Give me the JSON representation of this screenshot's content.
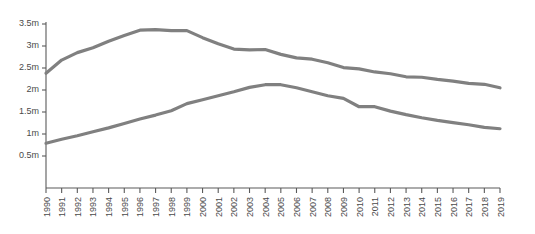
{
  "chart_data": {
    "type": "line",
    "title": "",
    "subtitle": "",
    "xlabel": "",
    "ylabel": "",
    "grid": false,
    "legend_position": "none",
    "xlim": [
      1990,
      2019
    ],
    "ylim": [
      0.25,
      3.5
    ],
    "y_tick_values": [
      0.5,
      1,
      1.5,
      2,
      2.5,
      3,
      3.5
    ],
    "y_tick_labels": [
      "0.5m",
      "1m",
      "1.5m",
      "2m",
      "2.5m",
      "3m",
      "3.5m"
    ],
    "x": [
      1990,
      1991,
      1992,
      1993,
      1994,
      1995,
      1996,
      1997,
      1998,
      1999,
      2000,
      2001,
      2002,
      2003,
      2004,
      2005,
      2006,
      2007,
      2008,
      2009,
      2010,
      2011,
      2012,
      2013,
      2014,
      2015,
      2016,
      2017,
      2018,
      2019
    ],
    "categories": [
      "1990",
      "1991",
      "1992",
      "1993",
      "1994",
      "1995",
      "1996",
      "1997",
      "1998",
      "1999",
      "2000",
      "2001",
      "2002",
      "2003",
      "2004",
      "2005",
      "2006",
      "2007",
      "2008",
      "2009",
      "2010",
      "2011",
      "2012",
      "2013",
      "2014",
      "2015",
      "2016",
      "2017",
      "2018",
      "2019"
    ],
    "series": [
      {
        "name": "upper-series",
        "color": "#808080",
        "values": [
          2.38,
          2.68,
          2.85,
          2.96,
          3.11,
          3.24,
          3.36,
          3.37,
          3.35,
          3.35,
          3.19,
          3.05,
          2.93,
          2.91,
          2.92,
          2.81,
          2.73,
          2.7,
          2.62,
          2.51,
          2.48,
          2.41,
          2.37,
          2.3,
          2.29,
          2.24,
          2.2,
          2.15,
          2.13,
          2.05
        ]
      },
      {
        "name": "lower-series",
        "color": "#808080",
        "values": [
          0.79,
          0.88,
          0.96,
          1.05,
          1.14,
          1.24,
          1.34,
          1.43,
          1.53,
          1.69,
          1.78,
          1.87,
          1.96,
          2.06,
          2.12,
          2.12,
          2.05,
          1.96,
          1.87,
          1.81,
          1.62,
          1.62,
          1.52,
          1.44,
          1.37,
          1.31,
          1.26,
          1.21,
          1.15,
          1.12
        ]
      }
    ]
  },
  "colors": {
    "line": "#808080",
    "axis": "#5a5a5a",
    "text": "#4a4a4a",
    "background": "#ffffff"
  }
}
